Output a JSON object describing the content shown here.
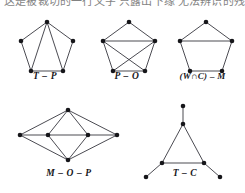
{
  "page": {
    "background_color": "#ffffff",
    "ink_color": "#16161a",
    "edge_color": "#2b2b33",
    "width": 245,
    "height": 193
  },
  "header": {
    "clipped_text_line": "这是被裁切的一行文字 只露出下缘 无法辨识的残留笔画"
  },
  "figures": [
    {
      "id": "figure-t-p",
      "caption": "T – P",
      "graph": {
        "type": "pentagon-with-two-chords",
        "vertex_count": 5,
        "edge_count": 7,
        "vertices": [
          {
            "name": "top",
            "x": 41,
            "y": 12
          },
          {
            "name": "upper-left",
            "x": 15,
            "y": 31
          },
          {
            "name": "upper-right",
            "x": 67,
            "y": 31
          },
          {
            "name": "bottom-left",
            "x": 25,
            "y": 61
          },
          {
            "name": "bottom-right",
            "x": 57,
            "y": 61
          }
        ],
        "edges": [
          [
            "top",
            "upper-left"
          ],
          [
            "top",
            "upper-right"
          ],
          [
            "upper-left",
            "bottom-left"
          ],
          [
            "upper-right",
            "bottom-right"
          ],
          [
            "bottom-left",
            "bottom-right"
          ],
          [
            "top",
            "bottom-left"
          ],
          [
            "top",
            "bottom-right"
          ]
        ]
      }
    },
    {
      "id": "figure-p-o",
      "caption": "P – O",
      "graph": {
        "type": "pentagon-with-crossing-chords",
        "vertex_count": 5,
        "edge_count": 8,
        "vertices": [
          {
            "name": "top",
            "x": 41,
            "y": 12
          },
          {
            "name": "upper-left",
            "x": 15,
            "y": 31
          },
          {
            "name": "upper-right",
            "x": 67,
            "y": 31
          },
          {
            "name": "bottom-left",
            "x": 25,
            "y": 61
          },
          {
            "name": "bottom-right",
            "x": 57,
            "y": 61
          }
        ],
        "edges": [
          [
            "top",
            "upper-left"
          ],
          [
            "top",
            "upper-right"
          ],
          [
            "upper-left",
            "bottom-left"
          ],
          [
            "upper-right",
            "bottom-right"
          ],
          [
            "bottom-left",
            "bottom-right"
          ],
          [
            "upper-left",
            "upper-right"
          ],
          [
            "upper-left",
            "bottom-right"
          ],
          [
            "upper-right",
            "bottom-left"
          ]
        ]
      }
    },
    {
      "id": "figure-wc-m",
      "caption": "(W∩C) – M",
      "graph": {
        "type": "pentagon-with-one-chord",
        "vertex_count": 5,
        "edge_count": 6,
        "vertices": [
          {
            "name": "top",
            "x": 41,
            "y": 12
          },
          {
            "name": "upper-left",
            "x": 15,
            "y": 31
          },
          {
            "name": "upper-right",
            "x": 67,
            "y": 31
          },
          {
            "name": "bottom-left",
            "x": 25,
            "y": 61
          },
          {
            "name": "bottom-right",
            "x": 57,
            "y": 61
          }
        ],
        "edges": [
          [
            "top",
            "upper-left"
          ],
          [
            "top",
            "upper-right"
          ],
          [
            "upper-left",
            "bottom-left"
          ],
          [
            "upper-right",
            "bottom-right"
          ],
          [
            "bottom-left",
            "bottom-right"
          ],
          [
            "upper-left",
            "upper-right"
          ]
        ]
      }
    },
    {
      "id": "figure-m-o-p",
      "caption": "M – O – P",
      "graph": {
        "type": "double-diamond-lattice",
        "vertex_count": 6,
        "edge_count": 9,
        "vertices": [
          {
            "name": "top",
            "x": 56,
            "y": 8
          },
          {
            "name": "bottom",
            "x": 56,
            "y": 58
          },
          {
            "name": "far-left",
            "x": 8,
            "y": 33
          },
          {
            "name": "inner-left",
            "x": 36,
            "y": 33
          },
          {
            "name": "inner-right",
            "x": 76,
            "y": 33
          },
          {
            "name": "far-right",
            "x": 105,
            "y": 33
          }
        ],
        "edges": [
          [
            "far-left",
            "top"
          ],
          [
            "far-left",
            "bottom"
          ],
          [
            "far-left",
            "inner-left"
          ],
          [
            "inner-left",
            "top"
          ],
          [
            "inner-left",
            "bottom"
          ],
          [
            "inner-left",
            "inner-right"
          ],
          [
            "inner-right",
            "top"
          ],
          [
            "inner-right",
            "bottom"
          ],
          [
            "inner-right",
            "far-right"
          ],
          [
            "far-right",
            "top"
          ],
          [
            "far-right",
            "bottom"
          ]
        ]
      }
    },
    {
      "id": "figure-t-c",
      "caption": "T – C",
      "graph": {
        "type": "triangle-with-three-pendants",
        "vertex_count": 6,
        "edge_count": 6,
        "vertices": [
          {
            "name": "apex",
            "x": 40,
            "y": 23
          },
          {
            "name": "base-left",
            "x": 19,
            "y": 62
          },
          {
            "name": "base-right",
            "x": 61,
            "y": 62
          },
          {
            "name": "pendant-top",
            "x": 40,
            "y": 5
          },
          {
            "name": "pendant-left",
            "x": 3,
            "y": 76
          },
          {
            "name": "pendant-right",
            "x": 77,
            "y": 76
          }
        ],
        "edges": [
          [
            "apex",
            "base-left"
          ],
          [
            "apex",
            "base-right"
          ],
          [
            "base-left",
            "base-right"
          ],
          [
            "apex",
            "pendant-top"
          ],
          [
            "base-left",
            "pendant-left"
          ],
          [
            "base-right",
            "pendant-right"
          ]
        ]
      }
    }
  ]
}
